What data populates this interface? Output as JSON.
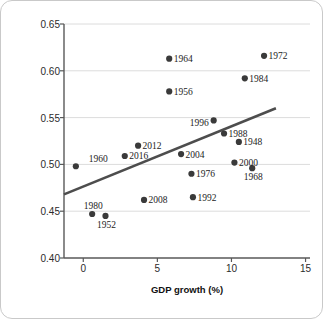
{
  "chart_data": {
    "type": "scatter",
    "title": "",
    "xlabel": "GDP growth (%)",
    "ylabel": "Incumbent party vote proportion",
    "xlim": [
      -1.3,
      15.3
    ],
    "ylim": [
      0.4,
      0.65
    ],
    "xticks": [
      "0",
      "5",
      "10",
      "15"
    ],
    "xtick_values": [
      0,
      5,
      10,
      15
    ],
    "yticks": [
      "0.40",
      "0.45",
      "0.50",
      "0.55",
      "0.60",
      "0.65"
    ],
    "ytick_values": [
      0.4,
      0.45,
      0.5,
      0.55,
      0.6,
      0.65
    ],
    "grid": "horizontal",
    "legend": "none",
    "point_color": "#3a3a3a",
    "trend_color": "#4d4d4d",
    "grid_color": "#dcdcdc",
    "axis_color": "#595959",
    "trend_line": {
      "x_start": -1.3,
      "y_start": 0.468,
      "x_end": 13.0,
      "y_end": 0.56
    },
    "points": [
      {
        "label": "1948",
        "x": 10.5,
        "y": 0.524,
        "label_pos": "right"
      },
      {
        "label": "1952",
        "x": 1.5,
        "y": 0.445,
        "label_pos": "below"
      },
      {
        "label": "1956",
        "x": 5.8,
        "y": 0.578,
        "label_pos": "right"
      },
      {
        "label": "1960",
        "x": -0.5,
        "y": 0.498,
        "label_pos": "right-far"
      },
      {
        "label": "1964",
        "x": 5.8,
        "y": 0.613,
        "label_pos": "right"
      },
      {
        "label": "1968",
        "x": 11.4,
        "y": 0.496,
        "label_pos": "below"
      },
      {
        "label": "1972",
        "x": 12.2,
        "y": 0.616,
        "label_pos": "right"
      },
      {
        "label": "1976",
        "x": 7.3,
        "y": 0.49,
        "label_pos": "right"
      },
      {
        "label": "1980",
        "x": 0.6,
        "y": 0.447,
        "label_pos": "above-left"
      },
      {
        "label": "1984",
        "x": 10.9,
        "y": 0.592,
        "label_pos": "right"
      },
      {
        "label": "1988",
        "x": 9.5,
        "y": 0.533,
        "label_pos": "right"
      },
      {
        "label": "1992",
        "x": 7.4,
        "y": 0.465,
        "label_pos": "right"
      },
      {
        "label": "1996",
        "x": 8.8,
        "y": 0.547,
        "label_pos": "left"
      },
      {
        "label": "2000",
        "x": 10.2,
        "y": 0.502,
        "label_pos": "right"
      },
      {
        "label": "2004",
        "x": 6.6,
        "y": 0.511,
        "label_pos": "right"
      },
      {
        "label": "2008",
        "x": 4.1,
        "y": 0.462,
        "label_pos": "right"
      },
      {
        "label": "2012",
        "x": 3.7,
        "y": 0.52,
        "label_pos": "right"
      },
      {
        "label": "2016",
        "x": 2.8,
        "y": 0.509,
        "label_pos": "right"
      }
    ]
  }
}
